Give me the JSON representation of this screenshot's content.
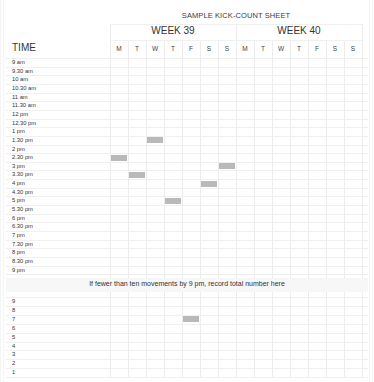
{
  "header": {
    "title": "SAMPLE KICK-COUNT SHEET",
    "weeks": [
      {
        "label": "WEEK 39"
      },
      {
        "label": "WEEK 40"
      }
    ],
    "time_label": "TIME",
    "days": [
      "M",
      "T",
      "W",
      "T",
      "F",
      "S",
      "S",
      "M",
      "T",
      "W",
      "T",
      "F",
      "S",
      "S"
    ]
  },
  "time_rows": [
    "9 am",
    "9.30 am",
    "10 am",
    "10.30 am",
    "11 am",
    "11.30 am",
    "12 pm",
    "12.30 pm",
    "1 pm",
    "1.30 pm",
    "2 pm",
    "2.30 pm",
    "3 pm",
    "3.30 pm",
    "4 pm",
    "4.30 pm",
    "5 pm",
    "5.30 pm",
    "6 pm",
    "6.30 pm",
    "7 pm",
    "7.30 pm",
    "8 pm",
    "8.30 pm",
    "9 pm"
  ],
  "banner": {
    "text": "If fewer than ten movements by 9 pm, record total number here"
  },
  "count_rows": [
    "9",
    "8",
    "7",
    "6",
    "5",
    "4",
    "3",
    "2",
    "1"
  ],
  "marks": {
    "time_section": [
      {
        "week": "WEEK 39",
        "day_index": 2,
        "day": "W",
        "time": "1.30 pm"
      },
      {
        "week": "WEEK 39",
        "day_index": 0,
        "day": "M",
        "time": "2.30 pm"
      },
      {
        "week": "WEEK 39",
        "day_index": 6,
        "day": "S",
        "time": "3 pm"
      },
      {
        "week": "WEEK 39",
        "day_index": 1,
        "day": "T",
        "time": "3.30 pm"
      },
      {
        "week": "WEEK 39",
        "day_index": 5,
        "day": "S",
        "time": "4 pm"
      },
      {
        "week": "WEEK 39",
        "day_index": 3,
        "day": "T",
        "time": "5 pm"
      }
    ],
    "count_section": [
      {
        "week": "WEEK 39",
        "day_index": 4,
        "day": "F",
        "count": "7"
      }
    ]
  },
  "colors": {
    "mark": "#b9b9b9",
    "grid": "#ececec",
    "banner_bg": "#f7f7f7",
    "text": "#333333"
  }
}
